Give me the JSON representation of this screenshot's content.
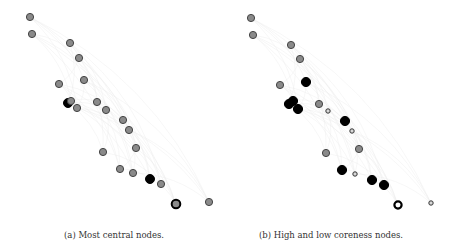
{
  "panels": [
    {
      "id": "a",
      "caption": "(a) Most central nodes.",
      "nodes": [
        {
          "x": 30,
          "y": 17,
          "r": 3.6,
          "fill": "#8a8a8a",
          "stroke": "#444444",
          "sw": 1
        },
        {
          "x": 32,
          "y": 34,
          "r": 3.6,
          "fill": "#8a8a8a",
          "stroke": "#444444",
          "sw": 1
        },
        {
          "x": 70,
          "y": 43,
          "r": 3.6,
          "fill": "#8a8a8a",
          "stroke": "#444444",
          "sw": 1
        },
        {
          "x": 79,
          "y": 58,
          "r": 3.6,
          "fill": "#8a8a8a",
          "stroke": "#444444",
          "sw": 1
        },
        {
          "x": 84,
          "y": 80,
          "r": 3.6,
          "fill": "#8a8a8a",
          "stroke": "#444444",
          "sw": 1
        },
        {
          "x": 59,
          "y": 84,
          "r": 3.6,
          "fill": "#8a8a8a",
          "stroke": "#444444",
          "sw": 1
        },
        {
          "x": 68,
          "y": 103,
          "r": 4.5,
          "fill": "#000000",
          "stroke": "#000000",
          "sw": 1
        },
        {
          "x": 71,
          "y": 101,
          "r": 3.6,
          "fill": "#8a8a8a",
          "stroke": "#444444",
          "sw": 1
        },
        {
          "x": 77,
          "y": 108,
          "r": 3.6,
          "fill": "#8a8a8a",
          "stroke": "#444444",
          "sw": 1
        },
        {
          "x": 97,
          "y": 102,
          "r": 3.6,
          "fill": "#8a8a8a",
          "stroke": "#444444",
          "sw": 1
        },
        {
          "x": 106,
          "y": 110,
          "r": 3.6,
          "fill": "#8a8a8a",
          "stroke": "#444444",
          "sw": 1
        },
        {
          "x": 123,
          "y": 120,
          "r": 3.6,
          "fill": "#8a8a8a",
          "stroke": "#444444",
          "sw": 1
        },
        {
          "x": 129,
          "y": 130,
          "r": 3.6,
          "fill": "#8a8a8a",
          "stroke": "#444444",
          "sw": 1
        },
        {
          "x": 136,
          "y": 148,
          "r": 3.6,
          "fill": "#8a8a8a",
          "stroke": "#444444",
          "sw": 1
        },
        {
          "x": 103,
          "y": 152,
          "r": 3.6,
          "fill": "#8a8a8a",
          "stroke": "#444444",
          "sw": 1
        },
        {
          "x": 120,
          "y": 169,
          "r": 3.6,
          "fill": "#8a8a8a",
          "stroke": "#444444",
          "sw": 1
        },
        {
          "x": 133,
          "y": 173,
          "r": 3.6,
          "fill": "#8a8a8a",
          "stroke": "#444444",
          "sw": 1
        },
        {
          "x": 150,
          "y": 179,
          "r": 4.5,
          "fill": "#000000",
          "stroke": "#000000",
          "sw": 1
        },
        {
          "x": 161,
          "y": 184,
          "r": 3.6,
          "fill": "#8a8a8a",
          "stroke": "#444444",
          "sw": 1
        },
        {
          "x": 176,
          "y": 204,
          "r": 4.3,
          "fill": "#8a8a8a",
          "stroke": "#000000",
          "sw": 2
        },
        {
          "x": 209,
          "y": 202,
          "r": 3.6,
          "fill": "#8a8a8a",
          "stroke": "#444444",
          "sw": 1
        }
      ]
    },
    {
      "id": "b",
      "caption": "(b) High and low coreness nodes.",
      "nodes": [
        {
          "x": 22,
          "y": 18,
          "r": 3.6,
          "fill": "#8a8a8a",
          "stroke": "#444444",
          "sw": 1
        },
        {
          "x": 24,
          "y": 35,
          "r": 3.6,
          "fill": "#8a8a8a",
          "stroke": "#444444",
          "sw": 1
        },
        {
          "x": 62,
          "y": 45,
          "r": 3.6,
          "fill": "#8a8a8a",
          "stroke": "#444444",
          "sw": 1
        },
        {
          "x": 71,
          "y": 59,
          "r": 3.6,
          "fill": "#8a8a8a",
          "stroke": "#444444",
          "sw": 1
        },
        {
          "x": 77,
          "y": 82,
          "r": 4.6,
          "fill": "#000000",
          "stroke": "#000000",
          "sw": 1
        },
        {
          "x": 51,
          "y": 85,
          "r": 3.6,
          "fill": "#8a8a8a",
          "stroke": "#444444",
          "sw": 1
        },
        {
          "x": 60,
          "y": 104,
          "r": 4.6,
          "fill": "#000000",
          "stroke": "#000000",
          "sw": 1
        },
        {
          "x": 64,
          "y": 101,
          "r": 4.6,
          "fill": "#000000",
          "stroke": "#000000",
          "sw": 1
        },
        {
          "x": 69,
          "y": 109,
          "r": 4.6,
          "fill": "#000000",
          "stroke": "#000000",
          "sw": 1
        },
        {
          "x": 90,
          "y": 104,
          "r": 3.6,
          "fill": "#8a8a8a",
          "stroke": "#444444",
          "sw": 1
        },
        {
          "x": 99,
          "y": 111,
          "r": 2.2,
          "fill": "#d8d8d8",
          "stroke": "#333333",
          "sw": 1
        },
        {
          "x": 116,
          "y": 121,
          "r": 4.6,
          "fill": "#000000",
          "stroke": "#000000",
          "sw": 1
        },
        {
          "x": 123,
          "y": 131,
          "r": 2.2,
          "fill": "#d8d8d8",
          "stroke": "#333333",
          "sw": 1
        },
        {
          "x": 130,
          "y": 149,
          "r": 3.6,
          "fill": "#8a8a8a",
          "stroke": "#444444",
          "sw": 1
        },
        {
          "x": 97,
          "y": 153,
          "r": 3.6,
          "fill": "#8a8a8a",
          "stroke": "#444444",
          "sw": 1
        },
        {
          "x": 113,
          "y": 170,
          "r": 4.6,
          "fill": "#000000",
          "stroke": "#000000",
          "sw": 1
        },
        {
          "x": 126,
          "y": 174,
          "r": 2.2,
          "fill": "#d8d8d8",
          "stroke": "#333333",
          "sw": 1
        },
        {
          "x": 143,
          "y": 180,
          "r": 4.6,
          "fill": "#000000",
          "stroke": "#000000",
          "sw": 1
        },
        {
          "x": 155,
          "y": 185,
          "r": 4.6,
          "fill": "#000000",
          "stroke": "#000000",
          "sw": 1
        },
        {
          "x": 169,
          "y": 205,
          "r": 3.6,
          "fill": "#ffffff",
          "stroke": "#000000",
          "sw": 2.2
        },
        {
          "x": 202,
          "y": 203,
          "r": 2.2,
          "fill": "#d8d8d8",
          "stroke": "#333333",
          "sw": 1
        }
      ]
    }
  ],
  "colors": {
    "edge": "#ebebeb",
    "node_default": "#8a8a8a",
    "node_highlight": "#000000"
  }
}
